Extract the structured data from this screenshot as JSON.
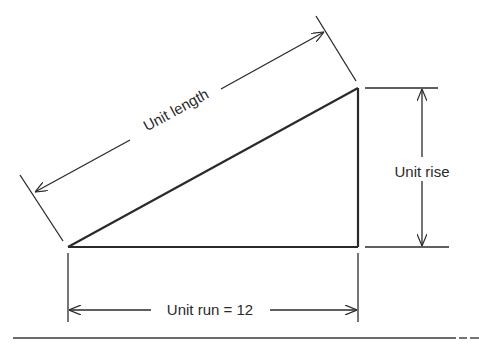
{
  "diagram": {
    "colors": {
      "stroke": "#2a2a2a",
      "background": "#ffffff"
    },
    "labels": {
      "unit_length": "Unit length",
      "unit_rise": "Unit rise",
      "unit_run": "Unit run = 12"
    },
    "triangle": {
      "vertices": [
        [
          68,
          247
        ],
        [
          358,
          88
        ],
        [
          358,
          247
        ]
      ]
    }
  }
}
